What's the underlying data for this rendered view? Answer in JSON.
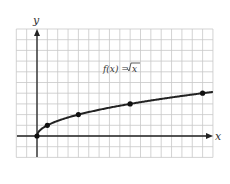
{
  "chart_data": {
    "type": "line",
    "title": "",
    "annotation": "f(x) = √x",
    "xlabel": "x",
    "ylabel": "y",
    "x": [
      0,
      1,
      4,
      9,
      16
    ],
    "series": [
      {
        "name": "f(x) = √x",
        "values": [
          0,
          1,
          2,
          3,
          4
        ],
        "markers": true
      }
    ],
    "xlim": [
      -2,
      17
    ],
    "ylim": [
      -2,
      10
    ],
    "grid": true,
    "tick_labels": false
  },
  "labels": {
    "x_axis": "x",
    "y_axis": "y",
    "function": "f(x) = √x",
    "function_name": "f(x) = ",
    "function_radicand": "x"
  },
  "colors": {
    "grid": "#c8c8c8",
    "axis": "#222222",
    "curve": "#222222"
  }
}
